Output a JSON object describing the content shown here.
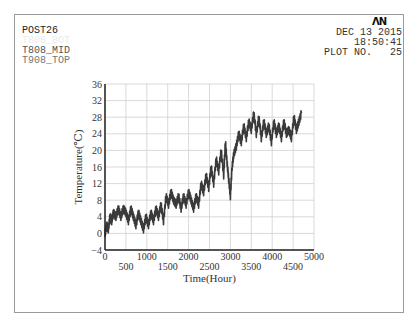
{
  "header": {
    "program": "POST26",
    "variables": [
      {
        "label": "T808_BOT",
        "style": "faint"
      },
      {
        "label": "T808_MID",
        "style": "mid"
      },
      {
        "label": "T908_TOP",
        "style": "top"
      }
    ],
    "logo": "ΛN",
    "date": "DEC 13 2015",
    "time": "18:50:41",
    "plot_no_label": "PLOT NO.",
    "plot_no": "25"
  },
  "colors": {
    "frame": "#9a9a9a",
    "grid": "#cfcfcf",
    "axis": "#222222",
    "series": "#3a3a3a"
  },
  "chart_data": {
    "type": "line",
    "title": "",
    "xlabel": "Time(Hour)",
    "ylabel": "Temperature(℃)",
    "xlim": [
      0,
      5000
    ],
    "ylim": [
      -4,
      36
    ],
    "x_ticks": [
      0,
      500,
      1000,
      1500,
      2000,
      2500,
      3000,
      3500,
      4000,
      4500,
      5000
    ],
    "y_ticks": [
      -4,
      0,
      4,
      8,
      12,
      16,
      20,
      24,
      28,
      32,
      36
    ],
    "grid": true,
    "legend": "none",
    "series": [
      {
        "name": "T808_MID",
        "x": [
          0,
          40,
          80,
          120,
          160,
          200,
          260,
          320,
          380,
          440,
          500,
          560,
          620,
          680,
          740,
          800,
          860,
          920,
          980,
          1040,
          1100,
          1160,
          1220,
          1280,
          1340,
          1400,
          1460,
          1520,
          1580,
          1640,
          1700,
          1760,
          1820,
          1880,
          1940,
          2000,
          2060,
          2120,
          2180,
          2240,
          2300,
          2360,
          2420,
          2480,
          2540,
          2600,
          2660,
          2720,
          2780,
          2840,
          2880,
          2920,
          2960,
          3000,
          3040,
          3080,
          3140,
          3200,
          3260,
          3320,
          3380,
          3440,
          3500,
          3560,
          3620,
          3680,
          3740,
          3800,
          3860,
          3920,
          3980,
          4040,
          4100,
          4160,
          4220,
          4280,
          4340,
          4400,
          4460,
          4520,
          4580,
          4640,
          4700
        ],
        "values": [
          0,
          2,
          1,
          4,
          3,
          5,
          4,
          6,
          4,
          6,
          5,
          3,
          6,
          4,
          2,
          5,
          3,
          1,
          4,
          2,
          5,
          3,
          6,
          4,
          7,
          3,
          9,
          7,
          10,
          8,
          7,
          9,
          6,
          9,
          7,
          10,
          8,
          6,
          9,
          7,
          12,
          10,
          14,
          11,
          16,
          12,
          18,
          15,
          20,
          14,
          22,
          17,
          13,
          9,
          16,
          19,
          21,
          24,
          22,
          26,
          23,
          27,
          25,
          29,
          24,
          28,
          23,
          27,
          24,
          26,
          22,
          27,
          24,
          26,
          23,
          27,
          24,
          25,
          23,
          28,
          25,
          27,
          29
        ]
      }
    ]
  }
}
